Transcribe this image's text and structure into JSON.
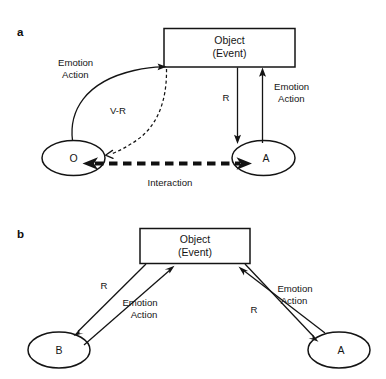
{
  "figure": {
    "background_color": "#ffffff",
    "line_color": "#141414",
    "panels": [
      {
        "id": "a",
        "letter": "a",
        "nodes": [
          {
            "id": "object_a",
            "shape": "rectangle",
            "line1": "Object",
            "line2": "(Event)"
          },
          {
            "id": "o_node",
            "shape": "ellipse",
            "label": "O"
          },
          {
            "id": "a_node",
            "shape": "ellipse",
            "label": "A"
          }
        ],
        "edges": [
          {
            "id": "o-to-object",
            "from": "O",
            "to": "Object (Event)",
            "style": "solid-curve",
            "label": "Emotion\nAction",
            "label_line1": "Emotion",
            "label_line2": "Action"
          },
          {
            "id": "object-to-o",
            "from": "Object (Event)",
            "to": "O",
            "style": "dashed-curve",
            "label": "V-R"
          },
          {
            "id": "object-to-a",
            "from": "Object (Event)",
            "to": "A",
            "style": "solid-straight",
            "label": "R"
          },
          {
            "id": "a-to-object",
            "from": "A",
            "to": "Object (Event)",
            "style": "solid-straight",
            "label_line1": "Emotion",
            "label_line2": "Action"
          },
          {
            "id": "o-a-interaction",
            "from": "O",
            "to": "A",
            "style": "thick-dashed-bidirectional",
            "label": "Interaction"
          }
        ]
      },
      {
        "id": "b",
        "letter": "b",
        "nodes": [
          {
            "id": "object_b",
            "shape": "rectangle",
            "line1": "Object",
            "line2": "(Event)"
          },
          {
            "id": "b_node",
            "shape": "ellipse",
            "label": "B"
          },
          {
            "id": "a_node_b",
            "shape": "ellipse",
            "label": "A"
          }
        ],
        "edges": [
          {
            "id": "object-to-b",
            "from": "Object (Event)",
            "to": "B",
            "style": "solid-straight",
            "label": "R"
          },
          {
            "id": "b-to-object",
            "from": "B",
            "to": "Object (Event)",
            "style": "solid-straight",
            "label_line1": "Emotion",
            "label_line2": "Action"
          },
          {
            "id": "object-to-a-b",
            "from": "Object (Event)",
            "to": "A",
            "style": "solid-straight",
            "label": "R"
          },
          {
            "id": "a-to-object-b",
            "from": "A",
            "to": "Object (Event)",
            "style": "solid-straight",
            "label_line1": "Emotion",
            "label_line2": "Action"
          }
        ]
      }
    ]
  },
  "labels": {
    "panel_a_letter": "a",
    "panel_b_letter": "b",
    "object_line1": "Object",
    "object_line2": "(Event)",
    "node_o": "O",
    "node_a": "A",
    "node_b": "B",
    "node_a_b": "A",
    "emotion": "Emotion",
    "action": "Action",
    "vr": "V-R",
    "r": "R",
    "interaction": "Interaction"
  }
}
